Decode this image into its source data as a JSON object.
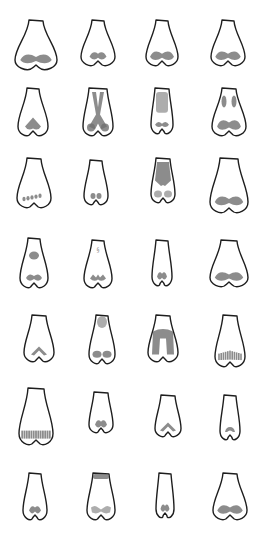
{
  "figure": {
    "rows": 7,
    "columns": 4,
    "colors": {
      "background": "#ffffff",
      "outline": "#1e1e1e",
      "shading": "#6f6f6f"
    },
    "items": [
      {
        "cx": 36,
        "top": 20,
        "bottom": 70,
        "topW": 14,
        "botW": 42,
        "shade": "nostrils-wide"
      },
      {
        "cx": 98,
        "top": 20,
        "bottom": 66,
        "topW": 12,
        "botW": 34,
        "shade": "nostrils-small"
      },
      {
        "cx": 162,
        "top": 20,
        "bottom": 66,
        "topW": 12,
        "botW": 32,
        "shade": "nostrils-wide"
      },
      {
        "cx": 228,
        "top": 20,
        "bottom": 66,
        "topW": 12,
        "botW": 34,
        "shade": "nostrils-wide"
      },
      {
        "cx": 33,
        "top": 88,
        "bottom": 136,
        "topW": 12,
        "botW": 30,
        "shade": "heart-center"
      },
      {
        "cx": 98,
        "top": 88,
        "bottom": 136,
        "topW": 18,
        "botW": 30,
        "shade": "x-bridge"
      },
      {
        "cx": 162,
        "top": 88,
        "bottom": 134,
        "topW": 14,
        "botW": 22,
        "shade": "bridge-block"
      },
      {
        "cx": 229,
        "top": 88,
        "bottom": 136,
        "topW": 14,
        "botW": 34,
        "shade": "bridge-pair"
      },
      {
        "cx": 34,
        "top": 158,
        "bottom": 208,
        "topW": 14,
        "botW": 34,
        "shade": "dots-row"
      },
      {
        "cx": 96,
        "top": 160,
        "bottom": 205,
        "topW": 12,
        "botW": 24,
        "shade": "two-dots"
      },
      {
        "cx": 163,
        "top": 158,
        "bottom": 203,
        "topW": 14,
        "botW": 24,
        "shade": "bridge-full"
      },
      {
        "cx": 229,
        "top": 158,
        "bottom": 213,
        "topW": 18,
        "botW": 38,
        "shade": "nostrils-wide"
      },
      {
        "cx": 34,
        "top": 238,
        "bottom": 288,
        "topW": 12,
        "botW": 28,
        "shade": "tip-and-nostrils"
      },
      {
        "cx": 98,
        "top": 240,
        "bottom": 288,
        "topW": 12,
        "botW": 28,
        "shade": "small-mark-nostrils"
      },
      {
        "cx": 162,
        "top": 240,
        "bottom": 286,
        "topW": 12,
        "botW": 20,
        "shade": "nostrils-small"
      },
      {
        "cx": 229,
        "top": 240,
        "bottom": 287,
        "topW": 16,
        "botW": 38,
        "shade": "nostrils-wide"
      },
      {
        "cx": 39,
        "top": 315,
        "bottom": 362,
        "topW": 14,
        "botW": 30,
        "shade": "chevron"
      },
      {
        "cx": 102,
        "top": 315,
        "bottom": 364,
        "topW": 12,
        "botW": 26,
        "shade": "top-and-nostrils"
      },
      {
        "cx": 163,
        "top": 315,
        "bottom": 362,
        "topW": 14,
        "botW": 30,
        "shade": "arch-block"
      },
      {
        "cx": 230,
        "top": 315,
        "bottom": 367,
        "topW": 14,
        "botW": 30,
        "shade": "striped"
      },
      {
        "cx": 36,
        "top": 388,
        "bottom": 445,
        "topW": 16,
        "botW": 34,
        "shade": "striped-row"
      },
      {
        "cx": 101,
        "top": 392,
        "bottom": 433,
        "topW": 14,
        "botW": 24,
        "shade": "nostrils-small"
      },
      {
        "cx": 168,
        "top": 395,
        "bottom": 437,
        "topW": 14,
        "botW": 26,
        "shade": "chevron"
      },
      {
        "cx": 230,
        "top": 395,
        "bottom": 440,
        "topW": 12,
        "botW": 20,
        "shade": "chevron-small"
      },
      {
        "cx": 35,
        "top": 473,
        "bottom": 520,
        "topW": 12,
        "botW": 24,
        "shade": "nostrils-small"
      },
      {
        "cx": 101,
        "top": 473,
        "bottom": 520,
        "topW": 16,
        "botW": 28,
        "shade": "top-band-nostrils"
      },
      {
        "cx": 165,
        "top": 473,
        "bottom": 518,
        "topW": 12,
        "botW": 18,
        "shade": "nostrils-small"
      },
      {
        "cx": 230,
        "top": 473,
        "bottom": 520,
        "topW": 14,
        "botW": 34,
        "shade": "nostrils-wide"
      }
    ]
  }
}
